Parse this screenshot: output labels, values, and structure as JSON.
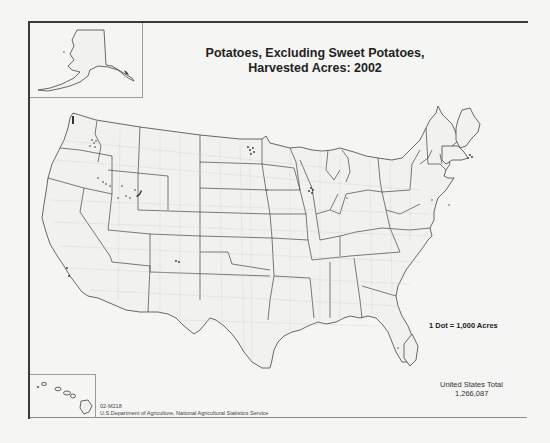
{
  "map": {
    "title_line1": "Potatoes, Excluding Sweet Potatoes,",
    "title_line2": "Harvested Acres:  2002",
    "legend": "1 Dot = 1,000 Acres",
    "total_label": "United States Total",
    "total_value": "1,266,087",
    "source_code": "02-M218",
    "source_agency": "U.S.Department of Agriculture, National Agricultural Statistics Service",
    "insets": [
      "Alaska",
      "Hawaii"
    ],
    "colors": {
      "background": "#f5f5f3",
      "state_borders": "#444444",
      "county_borders": "#c8c8c6",
      "dots": "#333333"
    },
    "dot_concentrations": [
      "Idaho (Snake River Plain)",
      "Washington (Columbia Basin)",
      "North Dakota / Minnesota (Red River Valley)",
      "Wisconsin (Central Sands)",
      "Maine (Aroostook County)",
      "Colorado (San Luis Valley)",
      "Oregon",
      "California",
      "Michigan",
      "New York",
      "Florida"
    ]
  }
}
